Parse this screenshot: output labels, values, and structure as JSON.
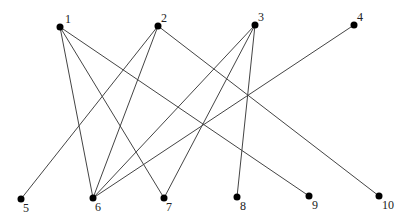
{
  "graph": {
    "type": "bipartite",
    "nodes": [
      {
        "id": "1",
        "label": "1",
        "x": 60,
        "y": 27,
        "lx": 65,
        "ly": 23
      },
      {
        "id": "2",
        "label": "2",
        "x": 158,
        "y": 26,
        "lx": 161,
        "ly": 22
      },
      {
        "id": "3",
        "label": "3",
        "x": 255,
        "y": 25,
        "lx": 258,
        "ly": 21
      },
      {
        "id": "4",
        "label": "4",
        "x": 354,
        "y": 25,
        "lx": 357,
        "ly": 21
      },
      {
        "id": "5",
        "label": "5",
        "x": 21,
        "y": 199,
        "lx": 23,
        "ly": 212
      },
      {
        "id": "6",
        "label": "6",
        "x": 93,
        "y": 198,
        "lx": 95,
        "ly": 211
      },
      {
        "id": "7",
        "label": "7",
        "x": 164,
        "y": 198,
        "lx": 166,
        "ly": 211
      },
      {
        "id": "8",
        "label": "8",
        "x": 237,
        "y": 197,
        "lx": 240,
        "ly": 210
      },
      {
        "id": "9",
        "label": "9",
        "x": 309,
        "y": 196,
        "lx": 312,
        "ly": 209
      },
      {
        "id": "10",
        "label": "10",
        "x": 379,
        "y": 196,
        "lx": 382,
        "ly": 209
      }
    ],
    "edges": [
      [
        "1",
        "6"
      ],
      [
        "1",
        "7"
      ],
      [
        "1",
        "9"
      ],
      [
        "2",
        "5"
      ],
      [
        "2",
        "6"
      ],
      [
        "2",
        "10"
      ],
      [
        "3",
        "6"
      ],
      [
        "3",
        "7"
      ],
      [
        "3",
        "8"
      ],
      [
        "4",
        "6"
      ]
    ],
    "colors": {
      "edge": "#444444",
      "node": "#000000"
    }
  }
}
